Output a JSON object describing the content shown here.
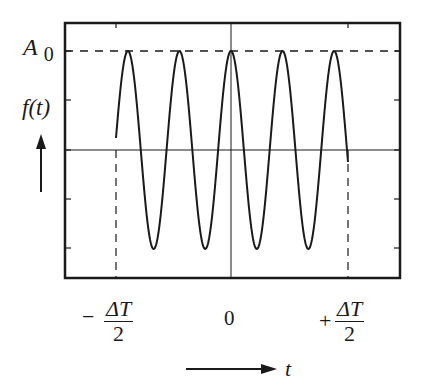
{
  "diagram": {
    "type": "truncated-cosine-wave-packet",
    "y_axis": {
      "label": "f(t)",
      "amplitude_label_main": "A",
      "amplitude_label_sub": "0"
    },
    "x_axis": {
      "label": "t",
      "tick_zero": "0",
      "left_bound": {
        "sign": "−",
        "numerator": "ΔT",
        "denominator": "2"
      },
      "right_bound": {
        "sign": "+",
        "numerator": "ΔT",
        "denominator": "2"
      }
    },
    "signal": {
      "function": "A0·cos(2πt/T) for |t| ≤ ΔT/2, else 0",
      "cycles_shown": 4.5,
      "peaks": 5,
      "troughs": 4
    },
    "colors": {
      "line": "#1a1a1a",
      "background": "#ffffff"
    }
  }
}
